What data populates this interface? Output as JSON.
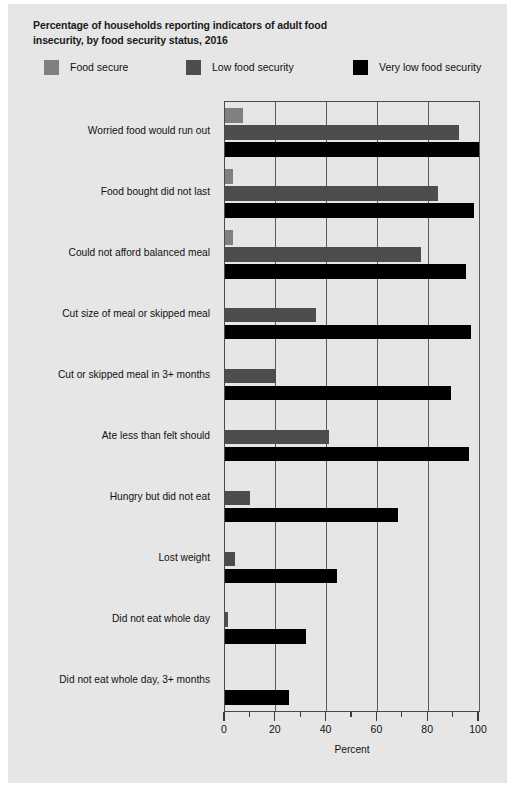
{
  "figure": {
    "background_color": "#e6e6e6",
    "title": "Percentage of households reporting indicators of adult food insecurity, by food security status, 2016"
  },
  "legend": {
    "items": [
      {
        "label": "Food secure",
        "color": "#808080"
      },
      {
        "label": "Low food security",
        "color": "#4d4d4d"
      },
      {
        "label": "Very low food security",
        "color": "#000000"
      }
    ]
  },
  "axes": {
    "x_title": "Percent",
    "x_ticklabels": [
      "0",
      "20",
      "40",
      "60",
      "80",
      "100"
    ],
    "x_tickvalues": [
      0,
      20,
      40,
      60,
      80,
      100
    ],
    "x_minor_tickvalues": [
      10,
      30,
      50,
      70,
      90
    ],
    "gridline_values": [
      20,
      40,
      60,
      80,
      100
    ]
  },
  "chart_data": {
    "type": "bar",
    "orientation": "horizontal",
    "title": "Percentage of households reporting indicators of adult food insecurity, by food security status, 2016",
    "xlabel": "Percent",
    "ylabel": "",
    "xlim": [
      0,
      100
    ],
    "grid": true,
    "legend_position": "top",
    "categories": [
      "Worried food would run out",
      "Food bought did not last",
      "Could not afford balanced meal",
      "Cut size of meal or skipped meal",
      "Cut or skipped meal in 3+ months",
      "Ate less than felt should",
      "Hungry but did not eat",
      "Lost weight",
      "Did not eat whole day",
      "Did not eat whole day, 3+ months"
    ],
    "series": [
      {
        "name": "Food secure",
        "color": "#808080",
        "values": [
          7,
          3,
          3,
          0,
          0,
          0,
          0,
          0,
          0,
          0
        ]
      },
      {
        "name": "Low food security",
        "color": "#4d4d4d",
        "values": [
          92,
          84,
          77,
          36,
          20,
          41,
          10,
          4,
          1,
          0
        ]
      },
      {
        "name": "Very low food security",
        "color": "#000000",
        "values": [
          100,
          98,
          95,
          97,
          89,
          96,
          68,
          44,
          32,
          25
        ]
      }
    ]
  }
}
